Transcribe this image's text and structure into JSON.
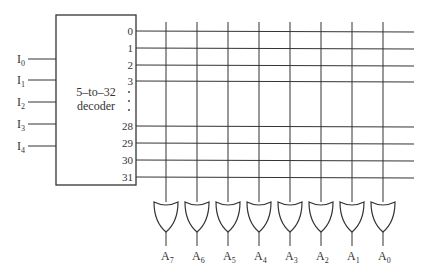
{
  "decoder": {
    "label_line1": "5–to–32",
    "label_line2": "decoder",
    "inputs": [
      {
        "base": "I",
        "sub": "0",
        "y": 59
      },
      {
        "base": "I",
        "sub": "1",
        "y": 80
      },
      {
        "base": "I",
        "sub": "2",
        "y": 102
      },
      {
        "base": "I",
        "sub": "3",
        "y": 124
      },
      {
        "base": "I",
        "sub": "4",
        "y": 146
      }
    ],
    "outputs": [
      {
        "label": "0",
        "y": 31
      },
      {
        "label": "1",
        "y": 48
      },
      {
        "label": "2",
        "y": 65
      },
      {
        "label": "3",
        "y": 81
      },
      {
        "label": "28",
        "y": 126
      },
      {
        "label": "29",
        "y": 143
      },
      {
        "label": "30",
        "y": 160
      },
      {
        "label": "31",
        "y": 177
      }
    ],
    "ellipsis": "⋮"
  },
  "or_gates": [
    {
      "base": "A",
      "sub": "7",
      "x": 166
    },
    {
      "base": "A",
      "sub": "6",
      "x": 197
    },
    {
      "base": "A",
      "sub": "5",
      "x": 228
    },
    {
      "base": "A",
      "sub": "4",
      "x": 259
    },
    {
      "base": "A",
      "sub": "3",
      "x": 290
    },
    {
      "base": "A",
      "sub": "2",
      "x": 321
    },
    {
      "base": "A",
      "sub": "1",
      "x": 352
    },
    {
      "base": "A",
      "sub": "0",
      "x": 383
    }
  ],
  "colors": {
    "line": "#333333",
    "background": "#ffffff"
  }
}
